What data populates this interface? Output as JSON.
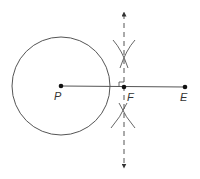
{
  "diagram": {
    "colors": {
      "stroke": "#555555",
      "point": "#111111",
      "background": "#ffffff"
    },
    "circle": {
      "center": "P",
      "cx": 61,
      "cy": 86,
      "r": 49
    },
    "points": [
      {
        "id": "P",
        "label": "P",
        "x": 61,
        "y": 86,
        "label_x": 54,
        "label_y": 100
      },
      {
        "id": "F",
        "label": "F",
        "x": 124,
        "y": 87,
        "label_x": 127,
        "label_y": 101
      },
      {
        "id": "E",
        "label": "E",
        "x": 185,
        "y": 87,
        "label_x": 180,
        "label_y": 101
      }
    ],
    "segment": {
      "from": "P",
      "to": "E"
    },
    "perpendicular_line": {
      "x": 124,
      "y_top": 14,
      "y_bottom": 166,
      "style": "dashed",
      "arrows": "both"
    },
    "right_angle_marker": {
      "at": "F",
      "size": 5
    },
    "construction_arcs": [
      {
        "position": "upper",
        "cross_x": 124,
        "cross_y": 53
      },
      {
        "position": "lower",
        "cross_x": 123,
        "cross_y": 113
      }
    ]
  }
}
